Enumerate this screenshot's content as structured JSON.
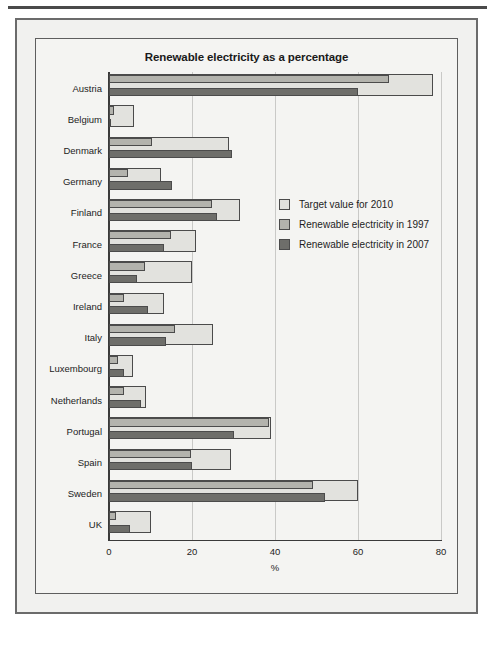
{
  "figure": {
    "title": "Renewable electricity as a percentage",
    "axis_caption": "%",
    "legend": [
      {
        "label": "Target value for 2010",
        "color": "#e2e2de",
        "key": "target"
      },
      {
        "label": "Renewable electricity in 1997",
        "color": "#b3b3ad",
        "key": "y1997"
      },
      {
        "label": "Renewable electricity in 2007",
        "color": "#6e6e6a",
        "key": "y2007"
      }
    ]
  },
  "chart_data": {
    "type": "bar",
    "orientation": "horizontal",
    "title": "Renewable electricity as a percentage",
    "xlabel": "%",
    "ylabel": "",
    "xlim": [
      0,
      80
    ],
    "xticks": [
      0,
      20,
      40,
      60,
      80
    ],
    "xtick_labels": [
      "0",
      "20",
      "40",
      "60",
      "80"
    ],
    "grid": true,
    "legend_position": "center-right",
    "categories": [
      "Austria",
      "Belgium",
      "Denmark",
      "Germany",
      "Finland",
      "France",
      "Greece",
      "Ireland",
      "Italy",
      "Luxembourg",
      "Netherlands",
      "Portugal",
      "Spain",
      "Sweden",
      "UK"
    ],
    "series": [
      {
        "name": "Target value for 2010",
        "color": "#e2e2de",
        "values": [
          78,
          6,
          29,
          12.5,
          31.5,
          21,
          20.1,
          13.2,
          25,
          5.7,
          9,
          39,
          29.4,
          60,
          10
        ]
      },
      {
        "name": "Renewable electricity in 1997",
        "color": "#b3b3ad",
        "values": [
          67.5,
          1.1,
          10.4,
          4.5,
          24.7,
          15,
          8.6,
          3.6,
          16,
          2.1,
          3.5,
          38.5,
          19.7,
          49.1,
          1.7
        ]
      },
      {
        "name": "Renewable electricity in 2007",
        "color": "#6e6e6a",
        "values": [
          60,
          0.5,
          29.6,
          15.1,
          26,
          13.3,
          6.8,
          9.3,
          13.7,
          3.7,
          7.6,
          30.1,
          20,
          52,
          5
        ]
      }
    ]
  }
}
